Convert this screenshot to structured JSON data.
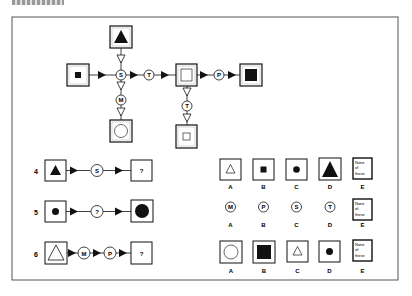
{
  "figure": {
    "type": "symbol-transformation-puzzle",
    "frame": {
      "stroke": "#555555"
    },
    "ink_color": "#111111"
  },
  "example_diagram": {
    "nodes": [
      {
        "id": "top_box",
        "shape": "filled-triangle",
        "label": ""
      },
      {
        "id": "left_box",
        "shape": "small-filled-square",
        "label": ""
      },
      {
        "id": "op_S",
        "operator": "S"
      },
      {
        "id": "op_T1",
        "operator": "T"
      },
      {
        "id": "mid_box",
        "shape": "outline-square",
        "label": ""
      },
      {
        "id": "op_P",
        "operator": "P"
      },
      {
        "id": "right_box",
        "shape": "large-filled-square",
        "label": ""
      },
      {
        "id": "op_M",
        "operator": "M"
      },
      {
        "id": "bottom_left_box",
        "shape": "outline-circle",
        "label": ""
      },
      {
        "id": "op_T2",
        "operator": "T"
      },
      {
        "id": "bottom_mid_box",
        "shape": "small-outline-square",
        "label": ""
      }
    ],
    "operators": {
      "S": "S",
      "T": "T",
      "P": "P",
      "M": "M"
    }
  },
  "questions": [
    {
      "number": "4",
      "sequence": [
        {
          "kind": "box",
          "shape": "filled-triangle"
        },
        {
          "kind": "op",
          "label": "S"
        },
        {
          "kind": "box",
          "label": "?"
        }
      ],
      "options": [
        {
          "letter": "A",
          "kind": "box",
          "shape": "outline-triangle"
        },
        {
          "letter": "B",
          "kind": "box",
          "shape": "small-filled-square"
        },
        {
          "letter": "C",
          "kind": "box",
          "shape": "filled-circle"
        },
        {
          "letter": "D",
          "kind": "box",
          "shape": "large-filled-triangle"
        },
        {
          "letter": "E",
          "kind": "none",
          "text": [
            "None",
            "of",
            "these"
          ]
        }
      ]
    },
    {
      "number": "5",
      "sequence": [
        {
          "kind": "box",
          "shape": "filled-circle"
        },
        {
          "kind": "op",
          "label": "?"
        },
        {
          "kind": "box",
          "shape": "large-filled-circle"
        }
      ],
      "options": [
        {
          "letter": "A",
          "kind": "op",
          "label": "M"
        },
        {
          "letter": "B",
          "kind": "op",
          "label": "P"
        },
        {
          "letter": "C",
          "kind": "op",
          "label": "S"
        },
        {
          "letter": "D",
          "kind": "op",
          "label": "T"
        },
        {
          "letter": "E",
          "kind": "none",
          "text": [
            "None",
            "of",
            "these"
          ]
        }
      ]
    },
    {
      "number": "6",
      "sequence": [
        {
          "kind": "box",
          "shape": "large-outline-triangle"
        },
        {
          "kind": "op",
          "label": "M"
        },
        {
          "kind": "op",
          "label": "P"
        },
        {
          "kind": "box",
          "label": "?"
        }
      ],
      "options": [
        {
          "letter": "A",
          "kind": "box",
          "shape": "large-outline-circle"
        },
        {
          "letter": "B",
          "kind": "box",
          "shape": "large-filled-square"
        },
        {
          "letter": "C",
          "kind": "box",
          "shape": "outline-triangle"
        },
        {
          "letter": "D",
          "kind": "box",
          "shape": "filled-circle"
        },
        {
          "letter": "E",
          "kind": "none",
          "text": [
            "None",
            "of",
            "these"
          ]
        }
      ]
    }
  ]
}
